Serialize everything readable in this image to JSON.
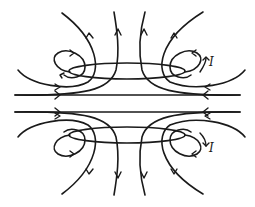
{
  "diagram": {
    "labels": {
      "upper_loop_current": "I",
      "lower_loop_current": "I"
    },
    "colors": {
      "line": "#1a1a1a",
      "background": "#ffffff"
    },
    "elements": {
      "loops": [
        "upper-current-loop",
        "lower-current-loop"
      ],
      "field_line_direction": "left-to-right through center"
    }
  }
}
